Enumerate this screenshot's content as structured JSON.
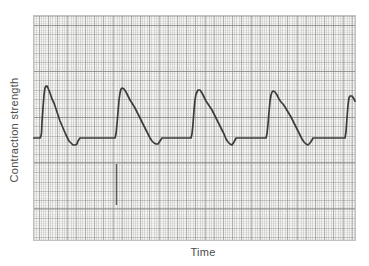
{
  "colors": {
    "page_bg": "#ffffff",
    "paper_bg": "#f5f5f3",
    "paper_edge": "#c2c2c0",
    "grid_fine_v": "#9a9a984d",
    "grid_fine_h": "#9a9a9826",
    "grid_med_v": "#8585837a",
    "grid_med_h": "#85858359",
    "grid_major_h": "#77777594",
    "trace": "#3c3c3c",
    "event_mark": "#5d5d5d",
    "label_text": "#4c4c4c"
  },
  "paper": {
    "left": 33,
    "top": 15,
    "width": 323,
    "height": 226
  },
  "chart_data": {
    "type": "line",
    "title": "",
    "xlabel": "Time",
    "ylabel": "Contraction strength",
    "axis_ticks": "none — unlabeled physiograph chart-recorder paper, no numeric scales",
    "grid": "graph paper: fine lines ~2px, medium lines ~9px, heavy horizontal rules ~46px",
    "legend_position": "none",
    "coordinate_system": "image pixels, y increases downward",
    "baseline_y_px": 138,
    "num_contractions_visible": 5,
    "peaks_px": [
      [
        46,
        86
      ],
      [
        122,
        88
      ],
      [
        199,
        90
      ],
      [
        273,
        91
      ],
      [
        351,
        96
      ]
    ],
    "series": [
      {
        "name": "contraction trace",
        "points": [
          [
            33,
            138
          ],
          [
            40,
            138
          ],
          [
            41,
            136
          ],
          [
            41.5,
            133
          ],
          [
            42,
            122
          ],
          [
            43,
            108
          ],
          [
            44,
            95
          ],
          [
            45,
            88
          ],
          [
            46,
            86
          ],
          [
            47,
            86
          ],
          [
            48,
            88
          ],
          [
            50,
            93
          ],
          [
            52,
            99
          ],
          [
            54,
            103
          ],
          [
            56,
            109
          ],
          [
            58,
            115
          ],
          [
            60,
            121
          ],
          [
            63,
            128
          ],
          [
            66,
            135
          ],
          [
            69,
            141
          ],
          [
            71,
            143
          ],
          [
            73,
            145
          ],
          [
            75,
            145
          ],
          [
            77,
            144
          ],
          [
            78,
            141
          ],
          [
            80,
            138
          ],
          [
            115,
            138
          ],
          [
            116,
            134
          ],
          [
            117,
            124
          ],
          [
            118,
            112
          ],
          [
            119,
            100
          ],
          [
            120,
            93
          ],
          [
            121,
            89
          ],
          [
            122,
            88
          ],
          [
            124,
            89
          ],
          [
            126,
            92
          ],
          [
            128,
            96
          ],
          [
            130,
            100
          ],
          [
            132,
            103
          ],
          [
            135,
            108
          ],
          [
            138,
            114
          ],
          [
            141,
            120
          ],
          [
            144,
            126
          ],
          [
            147,
            132
          ],
          [
            150,
            138
          ],
          [
            152,
            141
          ],
          [
            154,
            143
          ],
          [
            156,
            144
          ],
          [
            158,
            144
          ],
          [
            160,
            141
          ],
          [
            162,
            138
          ],
          [
            191,
            138
          ],
          [
            192,
            134
          ],
          [
            193,
            124
          ],
          [
            194,
            110
          ],
          [
            195,
            100
          ],
          [
            196,
            94
          ],
          [
            198,
            90
          ],
          [
            200,
            90
          ],
          [
            202,
            93
          ],
          [
            204,
            97
          ],
          [
            206,
            101
          ],
          [
            208,
            104
          ],
          [
            210,
            107
          ],
          [
            212,
            110
          ],
          [
            215,
            116
          ],
          [
            218,
            122
          ],
          [
            221,
            128
          ],
          [
            224,
            134
          ],
          [
            226,
            139
          ],
          [
            228,
            142
          ],
          [
            230,
            144
          ],
          [
            232,
            145
          ],
          [
            234,
            142
          ],
          [
            236,
            138
          ],
          [
            266,
            138
          ],
          [
            267,
            134
          ],
          [
            268,
            124
          ],
          [
            269,
            112
          ],
          [
            270,
            101
          ],
          [
            271,
            95
          ],
          [
            272,
            92
          ],
          [
            273,
            91
          ],
          [
            275,
            92
          ],
          [
            277,
            95
          ],
          [
            279,
            99
          ],
          [
            281,
            102
          ],
          [
            283,
            104
          ],
          [
            285,
            107
          ],
          [
            288,
            112
          ],
          [
            291,
            117
          ],
          [
            294,
            123
          ],
          [
            297,
            129
          ],
          [
            300,
            135
          ],
          [
            302,
            139
          ],
          [
            304,
            142
          ],
          [
            306,
            144
          ],
          [
            308,
            145
          ],
          [
            310,
            143
          ],
          [
            312,
            140
          ],
          [
            313,
            138
          ],
          [
            345,
            138
          ],
          [
            346,
            132
          ],
          [
            347,
            118
          ],
          [
            348,
            105
          ],
          [
            349,
            98
          ],
          [
            350,
            96
          ],
          [
            352,
            96
          ],
          [
            354,
            99
          ],
          [
            355,
            101
          ]
        ]
      }
    ],
    "event_marks": [
      {
        "name": "stimulus tick",
        "x": 116.5,
        "y1": 164,
        "y2": 205
      }
    ]
  }
}
